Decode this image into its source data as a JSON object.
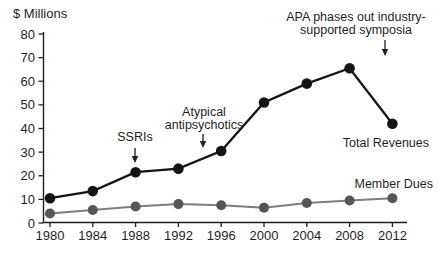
{
  "chart_data": {
    "type": "line",
    "title": "",
    "ylabel": "$ Millions",
    "xlabel": "",
    "x_tick_labels": [
      "1980",
      "1984",
      "1988",
      "1992",
      "1996",
      "2000",
      "2004",
      "2008",
      "2012"
    ],
    "y_tick_labels": [
      "0",
      "10",
      "20",
      "30",
      "40",
      "50",
      "60",
      "70",
      "80"
    ],
    "ylim": [
      0,
      80
    ],
    "grid": false,
    "legend_position": "direct labels at right end of each line",
    "categories": [
      1980,
      1984,
      1988,
      1992,
      1996,
      2000,
      2004,
      2008,
      2012
    ],
    "series": [
      {
        "name": "Total Revenues",
        "color": "#141414",
        "values": [
          10.5,
          13.5,
          21.5,
          23,
          30.5,
          51,
          59,
          65.5,
          42
        ]
      },
      {
        "name": "Member Dues",
        "color": "#565656",
        "values": [
          4,
          5.5,
          7,
          8,
          7.5,
          6.5,
          8.5,
          9.5,
          10.5
        ]
      }
    ],
    "annotations": [
      {
        "id": "ssris",
        "lines": [
          "SSRIs"
        ],
        "points_to": "Total Revenues line at 1988"
      },
      {
        "id": "atypical",
        "lines": [
          "Atypical",
          "antipsychotics"
        ],
        "points_to": "Total Revenues line between 1992 and 1996"
      },
      {
        "id": "apa",
        "lines": [
          "APA phases out industry-",
          "supported symposia"
        ],
        "points_to": "Total Revenues peak at 2008"
      }
    ]
  }
}
